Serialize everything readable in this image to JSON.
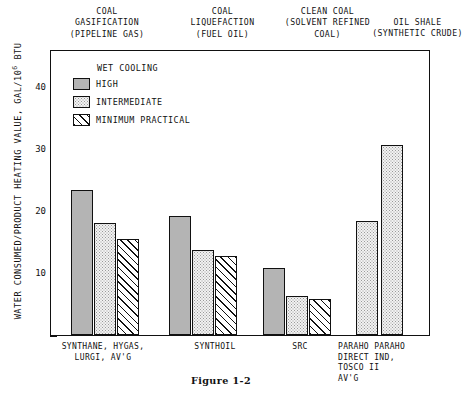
{
  "caption": "Figure 1-2",
  "axis": {
    "ylabel_main": "WATER CONSUMED/PRODUCT HEATING VALUE, GAL/10",
    "ylabel_exp": "6",
    "ylabel_unit": " BTU",
    "yticks": [
      "10",
      "20",
      "30",
      "40"
    ]
  },
  "legend": {
    "title": "WET COOLING",
    "items": [
      {
        "label": "HIGH",
        "pattern": "solid-gray"
      },
      {
        "label": "INTERMEDIATE",
        "pattern": "fine-dotted"
      },
      {
        "label": "MINIMUM PRACTICAL",
        "pattern": "diagonal-hatch"
      }
    ]
  },
  "groups": [
    {
      "header": "COAL\nGASIFICATION\n(PIPELINE GAS)",
      "xlabel": "SYNTHANE, HYGAS,\nLURGI, AV'G"
    },
    {
      "header": "COAL\nLIQUEFACTION\n(FUEL OIL)",
      "xlabel": "SYNTHOIL"
    },
    {
      "header": "CLEAN COAL\n(SOLVENT REFINED\nCOAL)",
      "xlabel": "SRC"
    },
    {
      "header": "OIL SHALE\n(SYNTHETIC CRUDE)",
      "xlabel": "PARAHO PARAHO\nDIRECT  IND,\n        TOSCO II\n        AV'G"
    }
  ],
  "chart_data": {
    "type": "bar",
    "title": "",
    "xlabel": "",
    "ylabel": "WATER CONSUMED/PRODUCT HEATING VALUE, GAL/10^6 BTU",
    "ylim": [
      0,
      46
    ],
    "yticks": [
      10,
      20,
      30,
      40
    ],
    "grid": false,
    "legend_position": "upper-left-inside",
    "categories": [
      "SYNTHANE, HYGAS, LURGI, AV'G",
      "SYNTHOIL",
      "SRC",
      "PARAHO DIRECT",
      "PARAHO IND, TOSCO II AV'G"
    ],
    "series": [
      {
        "name": "HIGH",
        "values": [
          23.5,
          19.3,
          10.8,
          null,
          null
        ]
      },
      {
        "name": "INTERMEDIATE",
        "values": [
          18.2,
          13.8,
          6.3,
          18.5,
          30.8
        ]
      },
      {
        "name": "MINIMUM PRACTICAL",
        "values": [
          15.5,
          12.8,
          5.8,
          null,
          null
        ]
      }
    ]
  }
}
